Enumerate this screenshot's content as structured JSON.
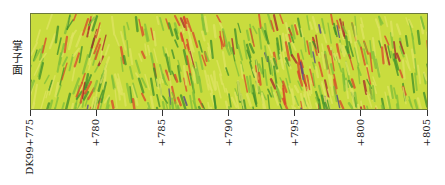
{
  "chart_data": {
    "type": "heatmap",
    "title": "",
    "ylabel": "掌子面",
    "xlabel": "",
    "x_ticks": [
      "DK99+775",
      "+780",
      "+785",
      "+790",
      "+795",
      "+800",
      "+805"
    ],
    "x_tick_values": [
      775,
      780,
      785,
      790,
      795,
      800,
      805
    ],
    "xlim": [
      775,
      805
    ],
    "colormap": [
      "#d7e04a",
      "#8cc63f",
      "#3f9a2e",
      "#e0542a",
      "#b0242a",
      "#4a3a8a"
    ]
  },
  "colors": {
    "background": "#c9dc3e",
    "light": "#dfe463",
    "green": "#7fbf3a",
    "dark_green": "#3d8f2a",
    "red": "#d9452a",
    "dark_red": "#a8232a",
    "blue": "#4b3d8c",
    "border": "#6b7a3a"
  }
}
